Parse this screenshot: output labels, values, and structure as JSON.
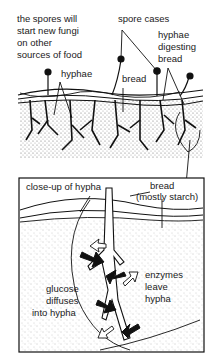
{
  "top_panel": {
    "labels": {
      "spores": [
        "the spores will",
        "start new fungi",
        "on other",
        "sources of food"
      ],
      "spore_cases": "spore cases",
      "hyphae_digesting": [
        "hyphae",
        "digesting",
        "bread"
      ],
      "hyphae": "hyphae",
      "bread": "bread"
    }
  },
  "closeup_panel": {
    "labels": {
      "closeup": "close-up of hypha",
      "bread_starch": [
        "bread",
        "(mostly starch)"
      ],
      "glucose": [
        "glucose",
        "diffuses",
        "into hypha"
      ],
      "enzymes": [
        "enzymes",
        "leave",
        "hypha"
      ]
    }
  },
  "colors": {
    "ink": "#111111",
    "background": "#ffffff",
    "stipple": "#9a9a9a"
  }
}
